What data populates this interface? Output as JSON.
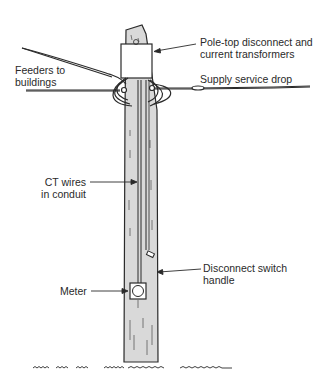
{
  "diagram": {
    "labels": {
      "pole_top": {
        "line1": "Pole-top disconnect and",
        "line2": "current transformers"
      },
      "feeders": {
        "line1": "Feeders to",
        "line2": "buildings"
      },
      "supply": {
        "line1": "Supply service drop"
      },
      "ct_wires": {
        "line1": "CT wires",
        "line2": "in conduit"
      },
      "disconnect_handle": {
        "line1": "Disconnect switch",
        "line2": "handle"
      },
      "meter": {
        "line1": "Meter"
      }
    },
    "colors": {
      "pole_fill": "#d9d9d9",
      "ink": "#2a2a2a",
      "background": "#ffffff"
    }
  }
}
